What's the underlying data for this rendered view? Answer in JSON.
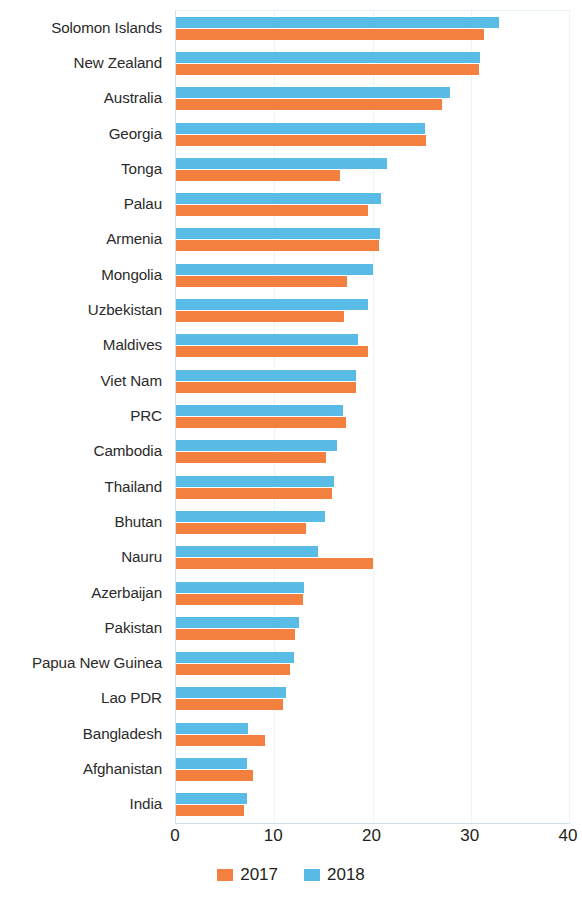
{
  "chart_data": {
    "type": "bar",
    "orientation": "horizontal",
    "title": "",
    "subtitle": "",
    "xlabel": "",
    "ylabel": "",
    "xlim": [
      0,
      40
    ],
    "xticks": [
      0,
      10,
      20,
      30,
      40
    ],
    "xtick_labels": [
      "0",
      "10",
      "20",
      "30",
      "40"
    ],
    "grid": true,
    "grid_axis": "x",
    "legend_position": "bottom-center",
    "categories": [
      "Solomon Islands",
      "New Zealand",
      "Australia",
      "Georgia",
      "Tonga",
      "Palau",
      "Armenia",
      "Mongolia",
      "Uzbekistan",
      "Maldives",
      "Viet Nam",
      "PRC",
      "Cambodia",
      "Thailand",
      "Bhutan",
      "Nauru",
      "Azerbaijan",
      "Pakistan",
      "Papua New Guinea",
      "Lao PDR",
      "Bangladesh",
      "Afghanistan",
      "India"
    ],
    "series": [
      {
        "name": "2017",
        "color": "#F4803F",
        "values": [
          31.3,
          30.8,
          27.1,
          25.4,
          16.7,
          19.5,
          20.7,
          17.4,
          17.1,
          19.5,
          18.3,
          17.3,
          15.3,
          15.9,
          13.2,
          20.0,
          12.9,
          12.1,
          11.6,
          10.9,
          9.1,
          7.8,
          6.9
        ]
      },
      {
        "name": "2018",
        "color": "#59BCE6",
        "values": [
          32.9,
          30.9,
          27.9,
          25.3,
          21.5,
          20.9,
          20.8,
          20.1,
          19.5,
          18.5,
          18.3,
          17.0,
          16.4,
          16.1,
          15.2,
          14.5,
          13.0,
          12.5,
          12.0,
          11.2,
          7.3,
          7.2,
          7.2
        ]
      }
    ],
    "legend": [
      {
        "label": "2017",
        "color": "#F4803F",
        "swatch": "legend-swatch-2017"
      },
      {
        "label": "2018",
        "color": "#59BCE6",
        "swatch": "legend-swatch-2018"
      }
    ]
  }
}
